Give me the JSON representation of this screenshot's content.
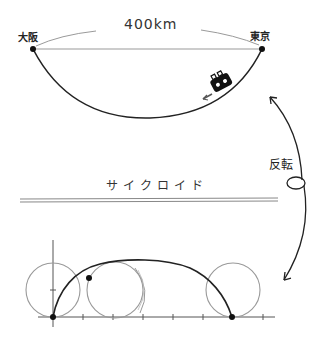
{
  "top_diagram": {
    "distance_label": "400km",
    "start_label": "大阪",
    "end_label": "東京",
    "vehicle_icon": "train-icon",
    "direction_icon": "arrow-icon"
  },
  "transform": {
    "label": "反転",
    "icon": "curved-double-arrow-icon"
  },
  "bottom_diagram": {
    "title": "サイクロイド",
    "circle_count": 3,
    "marked_points": 3
  },
  "colors": {
    "stroke_dark": "#222222",
    "stroke_light": "#9a9a9a",
    "background": "#ffffff"
  }
}
